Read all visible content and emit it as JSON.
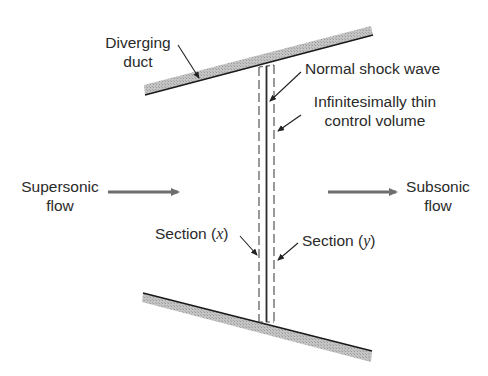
{
  "labels": {
    "diverging_duct_line1": "Diverging",
    "diverging_duct_line2": "duct",
    "normal_shock": "Normal shock wave",
    "control_volume_line1": "Infinitesimally thin",
    "control_volume_line2": "control volume",
    "supersonic_line1": "Supersonic",
    "supersonic_line2": "flow",
    "subsonic_line1": "Subsonic",
    "subsonic_line2": "flow",
    "section_x_prefix": "Section (",
    "section_x_var": "x",
    "section_x_suffix": ")",
    "section_y_prefix": "Section (",
    "section_y_var": "y",
    "section_y_suffix": ")"
  },
  "colors": {
    "wall_hatch": "#b8b8b8",
    "wall_line": "#1a1a1a",
    "flow_arrow": "#6e6e6e",
    "leader": "#222222",
    "text": "#2a2a2a"
  }
}
